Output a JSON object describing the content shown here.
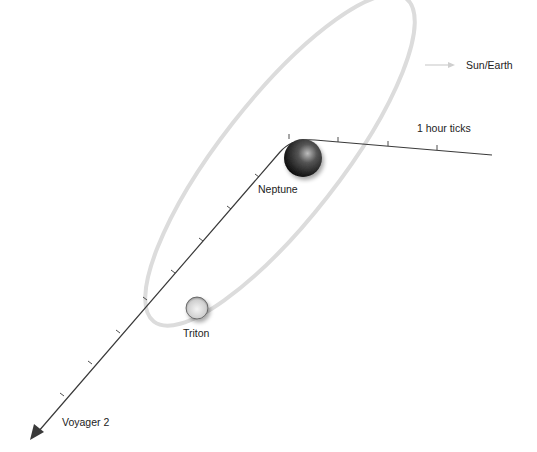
{
  "labels": {
    "sun_earth": "Sun/Earth",
    "ticks": "1 hour ticks",
    "neptune": "Neptune",
    "triton": "Triton",
    "voyager": "Voyager 2"
  },
  "colors": {
    "orbit": "#dcdcdc",
    "trajectory": "#3a3a3a",
    "arrow_sun": "#cfcfcf",
    "text": "#222222"
  }
}
